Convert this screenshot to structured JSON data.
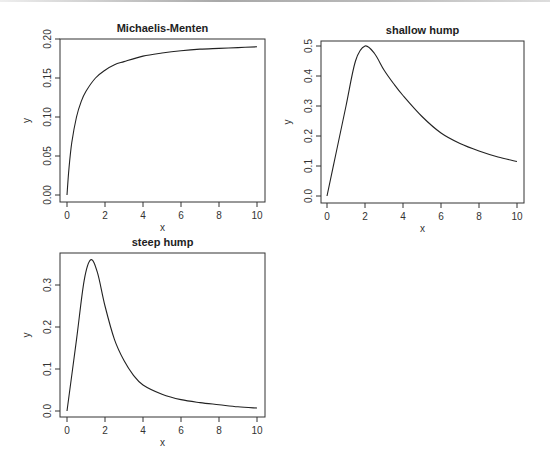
{
  "chart_data": [
    {
      "type": "line",
      "title": "Michaelis-Menten",
      "xlabel": "x",
      "ylabel": "y",
      "xlim": [
        0,
        10
      ],
      "ylim": [
        0,
        0.2
      ],
      "xticks": [
        "0",
        "2",
        "4",
        "6",
        "8",
        "10"
      ],
      "yticks": [
        "0.00",
        "0.05",
        "0.10",
        "0.15",
        "0.20"
      ],
      "grid": false,
      "x": [
        0,
        0.1,
        0.25,
        0.5,
        0.75,
        1,
        1.5,
        2,
        2.5,
        3,
        4,
        5,
        6,
        7,
        8,
        9,
        10
      ],
      "y": [
        0,
        0.033,
        0.067,
        0.1,
        0.12,
        0.133,
        0.15,
        0.16,
        0.167,
        0.171,
        0.178,
        0.182,
        0.185,
        0.187,
        0.188,
        0.189,
        0.19
      ]
    },
    {
      "type": "line",
      "title": "shallow hump",
      "xlabel": "x",
      "ylabel": "y",
      "xlim": [
        0,
        10
      ],
      "ylim": [
        0,
        0.5
      ],
      "xticks": [
        "0",
        "2",
        "4",
        "6",
        "8",
        "10"
      ],
      "yticks": [
        "0.0",
        "0.1",
        "0.2",
        "0.3",
        "0.4",
        "0.5"
      ],
      "grid": false,
      "x": [
        0,
        0.5,
        1,
        1.5,
        2,
        2.5,
        3,
        3.5,
        4,
        5,
        6,
        7,
        8,
        9,
        10
      ],
      "y": [
        0,
        0.15,
        0.3,
        0.45,
        0.5,
        0.475,
        0.42,
        0.375,
        0.335,
        0.265,
        0.21,
        0.175,
        0.15,
        0.13,
        0.115
      ]
    },
    {
      "type": "line",
      "title": "steep hump",
      "xlabel": "x",
      "ylabel": "y",
      "xlim": [
        0,
        10
      ],
      "ylim": [
        0,
        0.36
      ],
      "xticks": [
        "0",
        "2",
        "4",
        "6",
        "8",
        "10"
      ],
      "yticks": [
        "0.0",
        "0.1",
        "0.2",
        "0.3"
      ],
      "grid": false,
      "x": [
        0,
        0.5,
        0.9,
        1.25,
        1.6,
        2,
        2.5,
        3,
        3.5,
        4,
        5,
        6,
        7,
        8,
        9,
        10
      ],
      "y": [
        0,
        0.17,
        0.31,
        0.36,
        0.33,
        0.25,
        0.17,
        0.12,
        0.085,
        0.062,
        0.04,
        0.027,
        0.02,
        0.015,
        0.01,
        0.007
      ]
    }
  ]
}
